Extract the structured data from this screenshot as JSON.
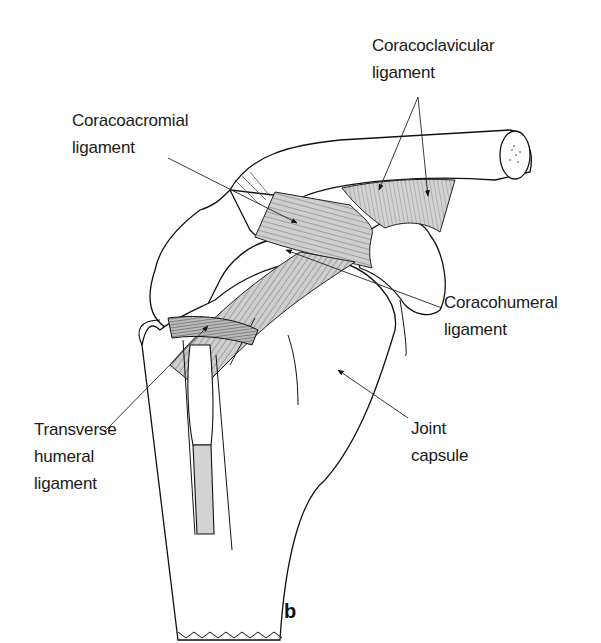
{
  "figure": {
    "panel_label": "b"
  },
  "labels": {
    "coracoclavicular": {
      "line1": "Coracoclavicular",
      "line2": "ligament"
    },
    "coracoacromial": {
      "line1": "Coracoacromial",
      "line2": "ligament"
    },
    "coracohumeral": {
      "line1": "Coracohumeral",
      "line2": "ligament"
    },
    "transverse_humeral": {
      "line1": "Transverse",
      "line2": "humeral",
      "line3": "ligament"
    },
    "joint_capsule": {
      "line1": "Joint",
      "line2": "capsule"
    }
  },
  "colors": {
    "ink": "#1a1a1a",
    "ligament_fill": "#c8c8c8",
    "background": "#ffffff"
  }
}
